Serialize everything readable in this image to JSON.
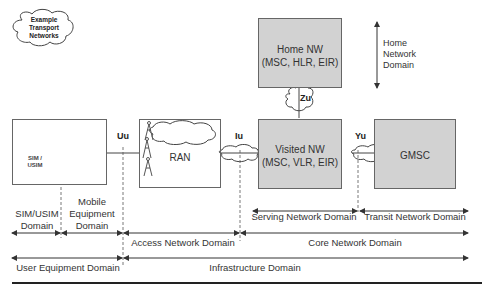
{
  "legend": {
    "cloud_label": "Example\nTransport\nNetworks",
    "lines": [
      "Example",
      "Transport",
      "Networks"
    ]
  },
  "nodes": {
    "home_nw": {
      "title": "Home NW",
      "sub": "(MSC, HLR,  EIR)"
    },
    "visited_nw": {
      "title": "Visited NW",
      "sub": "(MSC, VLR, EIR)"
    },
    "ran": {
      "title": "RAN"
    },
    "gmsc": {
      "title": "GMSC"
    },
    "sim": {
      "line1": "SIM /",
      "line2": "USIM"
    }
  },
  "interfaces": {
    "uu": "Uu",
    "iu": "Iu",
    "yu": "Yu",
    "zu": "Zu"
  },
  "domains": {
    "home_network": [
      "Home",
      "Network",
      "Domain"
    ],
    "sim_usim": [
      "SIM/USIM",
      "Domain"
    ],
    "mobile_equipment": [
      "Mobile",
      "Equipment",
      "Domain"
    ],
    "access_network": "Access Network Domain",
    "serving_network": "Serving Network Domain",
    "transit_network": "Transit Network Domain",
    "core_network": "Core Network Domain",
    "user_equipment": "User Equipment Domain",
    "infrastructure": "Infrastructure Domain"
  },
  "colors": {
    "box_fill": "#d2d2d2",
    "line": "#444444",
    "phone": "#3a3a3a"
  }
}
